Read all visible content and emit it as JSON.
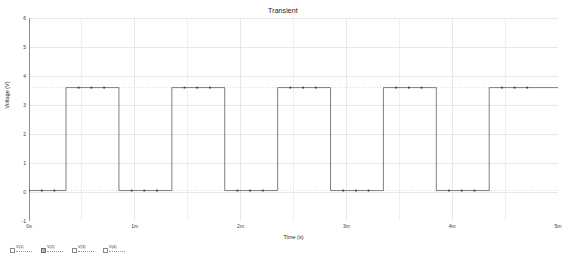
{
  "chart_data": {
    "type": "line",
    "title": "Transient",
    "xlabel": "Time (s)",
    "ylabel": "Voltage (V)",
    "xlim": [
      0,
      0.005
    ],
    "ylim": [
      -1,
      6
    ],
    "grid": true,
    "legend_position": "below-left",
    "x_tick_labels": [
      "0s",
      "1m",
      "2m",
      "3m",
      "4m",
      "5m"
    ],
    "x_tick_values": [
      0,
      0.001,
      0.002,
      0.003,
      0.004,
      0.005
    ],
    "y_tick_labels": [
      "-1",
      "0",
      "1",
      "2",
      "3",
      "4",
      "5",
      "6"
    ],
    "y_tick_values": [
      -1,
      0,
      1,
      2,
      3,
      4,
      5,
      6
    ],
    "reference_levels": [
      3.6,
      0.05
    ],
    "series": [
      {
        "name": "V(in)",
        "color": "#606060",
        "high": 3.6,
        "low": 0.05,
        "period": 0.001,
        "duty": 0.5,
        "first_rise": 0.00035,
        "points": [
          {
            "t": 0.0,
            "v": 0.05
          },
          {
            "t": 0.00012,
            "v": 0.05
          },
          {
            "t": 0.00024,
            "v": 0.05
          },
          {
            "t": 0.00035,
            "v": 0.05
          },
          {
            "t": 0.00035,
            "v": 3.6
          },
          {
            "t": 0.00047,
            "v": 3.6
          },
          {
            "t": 0.00059,
            "v": 3.6
          },
          {
            "t": 0.00071,
            "v": 3.6
          },
          {
            "t": 0.00085,
            "v": 3.6
          },
          {
            "t": 0.00085,
            "v": 0.05
          },
          {
            "t": 0.00097,
            "v": 0.05
          },
          {
            "t": 0.00109,
            "v": 0.05
          },
          {
            "t": 0.00121,
            "v": 0.05
          },
          {
            "t": 0.00135,
            "v": 0.05
          },
          {
            "t": 0.00135,
            "v": 3.6
          },
          {
            "t": 0.00147,
            "v": 3.6
          },
          {
            "t": 0.00159,
            "v": 3.6
          },
          {
            "t": 0.00171,
            "v": 3.6
          },
          {
            "t": 0.00185,
            "v": 3.6
          },
          {
            "t": 0.00185,
            "v": 0.05
          },
          {
            "t": 0.00197,
            "v": 0.05
          },
          {
            "t": 0.00209,
            "v": 0.05
          },
          {
            "t": 0.00221,
            "v": 0.05
          },
          {
            "t": 0.00235,
            "v": 0.05
          },
          {
            "t": 0.00235,
            "v": 3.6
          },
          {
            "t": 0.00247,
            "v": 3.6
          },
          {
            "t": 0.00259,
            "v": 3.6
          },
          {
            "t": 0.00271,
            "v": 3.6
          },
          {
            "t": 0.00285,
            "v": 3.6
          },
          {
            "t": 0.00285,
            "v": 0.05
          },
          {
            "t": 0.00297,
            "v": 0.05
          },
          {
            "t": 0.00309,
            "v": 0.05
          },
          {
            "t": 0.00321,
            "v": 0.05
          },
          {
            "t": 0.00335,
            "v": 0.05
          },
          {
            "t": 0.00335,
            "v": 3.6
          },
          {
            "t": 0.00347,
            "v": 3.6
          },
          {
            "t": 0.00359,
            "v": 3.6
          },
          {
            "t": 0.00371,
            "v": 3.6
          },
          {
            "t": 0.00385,
            "v": 3.6
          },
          {
            "t": 0.00385,
            "v": 0.05
          },
          {
            "t": 0.00397,
            "v": 0.05
          },
          {
            "t": 0.00409,
            "v": 0.05
          },
          {
            "t": 0.00421,
            "v": 0.05
          },
          {
            "t": 0.00435,
            "v": 0.05
          },
          {
            "t": 0.00435,
            "v": 3.6
          },
          {
            "t": 0.00447,
            "v": 3.6
          },
          {
            "t": 0.00459,
            "v": 3.6
          },
          {
            "t": 0.00471,
            "v": 3.6
          },
          {
            "t": 0.005,
            "v": 3.6
          }
        ]
      }
    ]
  },
  "legend": {
    "items": [
      {
        "name": "V(1)",
        "selected": false
      },
      {
        "name": "V(2)",
        "selected": true
      },
      {
        "name": "V(3)",
        "selected": false
      },
      {
        "name": "V(4)",
        "selected": false
      }
    ]
  }
}
